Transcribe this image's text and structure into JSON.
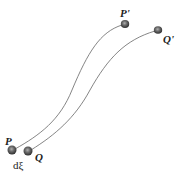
{
  "diagram": {
    "curves": [
      {
        "from": "P",
        "to": "P'"
      },
      {
        "from": "Q",
        "to": "Q'"
      }
    ],
    "points": {
      "P": {
        "label": "P"
      },
      "Q": {
        "label": "Q"
      },
      "P_prime": {
        "label": "P'"
      },
      "Q_prime": {
        "label": "Q'"
      }
    },
    "separation_label": "dξ",
    "colors": {
      "curve": "#555555",
      "point": "#444444",
      "point_highlight": "#9a9a9a"
    }
  }
}
